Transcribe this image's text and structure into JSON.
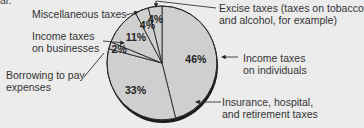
{
  "page": {
    "clipped_top_text": "ar."
  },
  "chart_data": {
    "type": "pie",
    "title": "",
    "start_angle_deg": 0,
    "direction": "clockwise",
    "colors": {
      "slice_fill": "#cfcfcf",
      "outline": "#1a1a1a",
      "background": "#ececec"
    },
    "slices": [
      {
        "label": "Income taxes on individuals",
        "value": 46,
        "display": "46%"
      },
      {
        "label": "Insurance, hospital, and retirement taxes",
        "value": 33,
        "display": "33%"
      },
      {
        "label": "Borrowing to pay expenses",
        "value": 2,
        "display": "2%"
      },
      {
        "label": "Income taxes on businesses",
        "value": 11,
        "display": "11%"
      },
      {
        "label": "Miscellaneous taxes",
        "value": 4,
        "display": "4%"
      },
      {
        "label": "Excise taxes (taxes on tobacco and alcohol, for example)",
        "value": 4,
        "display": "4%"
      }
    ]
  },
  "labels": {
    "individuals": {
      "line1": "Income taxes",
      "line2": "on individuals"
    },
    "insurance": {
      "line1": "Insurance, hospital,",
      "line2": "and retirement taxes"
    },
    "borrowing": {
      "line1": "Borrowing to pay",
      "line2": "expenses"
    },
    "businesses": {
      "line1": "Income taxes",
      "line2": "on businesses"
    },
    "misc": {
      "line1": "Miscellaneous taxes"
    },
    "excise": {
      "line1": "Excise taxes (taxes on tobacco",
      "line2": "and alcohol, for example)"
    }
  }
}
